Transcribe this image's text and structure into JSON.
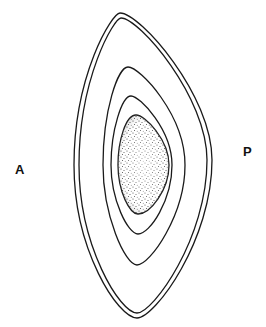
{
  "diagram": {
    "labels": {
      "left": "A",
      "right": "P"
    },
    "structure": {
      "outer_wall_layers": 2,
      "inner_rings": 2,
      "core": "stippled"
    },
    "colors": {
      "line": "#1a1a1a",
      "background": "#ffffff",
      "stipple": "#222222"
    }
  }
}
